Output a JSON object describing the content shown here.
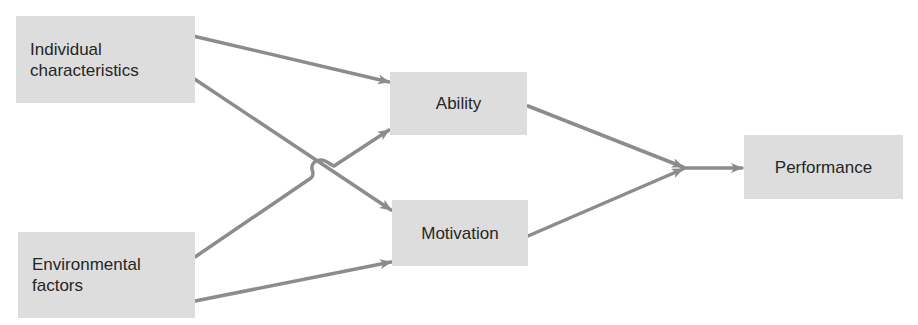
{
  "diagram": {
    "colors": {
      "box_fill": "#dddddd",
      "text": "#262626",
      "arrow": "#8c8c8c",
      "background": "#ffffff"
    },
    "nodes": [
      {
        "id": "individual",
        "label": "Individual\ncharacteristics",
        "x": 16,
        "y": 16,
        "w": 179,
        "h": 87,
        "align": "left"
      },
      {
        "id": "environmental",
        "label": "Environmental\nfactors",
        "x": 18,
        "y": 232,
        "w": 177,
        "h": 86,
        "align": "left"
      },
      {
        "id": "ability",
        "label": "Ability",
        "x": 390,
        "y": 72,
        "w": 137,
        "h": 63,
        "align": "center"
      },
      {
        "id": "motivation",
        "label": "Motivation",
        "x": 392,
        "y": 200,
        "w": 136,
        "h": 66,
        "align": "center"
      },
      {
        "id": "performance",
        "label": "Performance",
        "x": 744,
        "y": 135,
        "w": 159,
        "h": 64,
        "align": "center"
      }
    ],
    "edges": [
      {
        "from": "individual",
        "to": "ability"
      },
      {
        "from": "individual",
        "to": "motivation"
      },
      {
        "from": "environmental",
        "to": "ability",
        "note": "hops over individual-to-motivation line"
      },
      {
        "from": "environmental",
        "to": "motivation"
      },
      {
        "from": "ability",
        "to": "performance",
        "via": "junction"
      },
      {
        "from": "motivation",
        "to": "performance",
        "via": "junction"
      }
    ]
  }
}
